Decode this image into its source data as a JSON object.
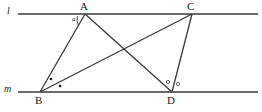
{
  "figure": {
    "type": "geometry-diagram",
    "width": 262,
    "height": 112,
    "background": "#ffffff",
    "stroke_color": "#3a3a3a",
    "text_color": "#1a1a1a"
  },
  "lines": [
    {
      "name": "l",
      "label": "l",
      "label_x": 7,
      "label_y": 5,
      "y": 14,
      "x1": 18,
      "x2": 258
    },
    {
      "name": "m",
      "label": "m",
      "label_x": 4,
      "label_y": 83,
      "y": 92,
      "x1": 18,
      "x2": 258
    }
  ],
  "points": [
    {
      "id": "A",
      "label": "A",
      "x": 85,
      "y": 14,
      "label_x": 80,
      "label_y": 0
    },
    {
      "id": "C",
      "label": "C",
      "x": 192,
      "y": 14,
      "label_x": 187,
      "label_y": 0
    },
    {
      "id": "B",
      "label": "B",
      "x": 40,
      "y": 92,
      "label_x": 35,
      "label_y": 94
    },
    {
      "id": "D",
      "label": "D",
      "x": 172,
      "y": 92,
      "label_x": 167,
      "label_y": 94
    }
  ],
  "segments": [
    {
      "name": "segment-AB",
      "from": "A",
      "to": "B",
      "x1": 85,
      "y1": 14,
      "x2": 40,
      "y2": 92
    },
    {
      "name": "segment-AD",
      "from": "A",
      "to": "D",
      "x1": 85,
      "y1": 14,
      "x2": 172,
      "y2": 92
    },
    {
      "name": "segment-BC",
      "from": "B",
      "to": "C",
      "x1": 40,
      "y1": 92,
      "x2": 192,
      "y2": 14
    },
    {
      "name": "segment-CD",
      "from": "C",
      "to": "D",
      "x1": 192,
      "y1": 14,
      "x2": 172,
      "y2": 92
    }
  ],
  "angle_marks": [
    {
      "name": "angle-a-at-A",
      "kind": "arc-with-letter",
      "vertex": "A",
      "label": "a",
      "label_x": 72,
      "label_y": 15,
      "arc_path": "M 78.5 25.5 A 12 12 0 0 1 77.5 16.0"
    },
    {
      "name": "angle-dot-B-upper",
      "kind": "filled-dot",
      "vertex": "B",
      "cx": 51,
      "cy": 79,
      "r": 1.3
    },
    {
      "name": "angle-dot-B-lower",
      "kind": "filled-dot",
      "vertex": "B",
      "cx": 60,
      "cy": 86,
      "r": 1.3
    },
    {
      "name": "angle-circle-D-left",
      "kind": "open-circle",
      "vertex": "D",
      "cx": 168,
      "cy": 82,
      "r": 1.6
    },
    {
      "name": "angle-circle-D-right",
      "kind": "open-circle",
      "vertex": "D",
      "cx": 178,
      "cy": 84,
      "r": 1.6
    }
  ]
}
